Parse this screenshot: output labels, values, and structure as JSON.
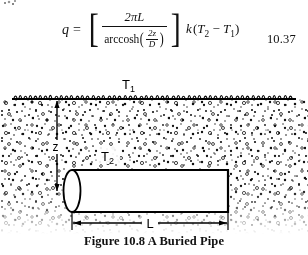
{
  "equation": {
    "lhs_variable": "q",
    "equals": "=",
    "numerator": "2πL",
    "denominator_function": "arccosh",
    "denominator_arg_numerator": "2z",
    "denominator_arg_denominator": "D",
    "multiplier_k": "k",
    "temperature_term": "(T₂ − T₁)",
    "temperature_hot": "T",
    "temperature_hot_sub": "2",
    "temperature_cold": "T",
    "temperature_cold_sub": "1",
    "minus": "−",
    "number": "10.37"
  },
  "diagram": {
    "surface_temperature_label": "T",
    "surface_temperature_sub": "1",
    "pipe_temperature_label": "T",
    "pipe_temperature_sub": "2",
    "depth_label": "z",
    "length_label": "L",
    "ground_fill_color": "#ffffff",
    "line_color": "#000000"
  },
  "caption": {
    "prefix": "Figure",
    "number": "10.8",
    "title": "A Buried Pipe",
    "full": "Figure 10.8 A Buried Pipe"
  }
}
